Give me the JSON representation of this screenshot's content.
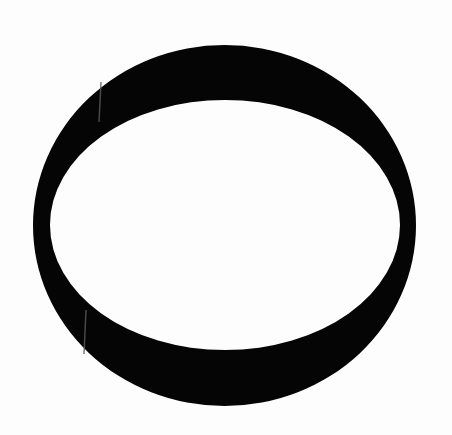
{
  "image": {
    "width": 452,
    "height": 435,
    "background_color": "#fdfdfd",
    "subject": "black elliptical ring on white paper (scanned)"
  },
  "ring": {
    "color": "#050505",
    "outer": {
      "cx": 224.5,
      "cy": 225.5,
      "rx": 191.5,
      "ry": 180.5
    },
    "inner": {
      "cx": 225,
      "cy": 225,
      "rx": 175,
      "ry": 125
    },
    "inner_fill": "#ffffff"
  },
  "artifacts": [
    {
      "type": "scan-streak",
      "x1": 101,
      "y1": 82,
      "x2": 99,
      "y2": 122,
      "color": "#5a5a5a"
    },
    {
      "type": "scan-streak",
      "x1": 86,
      "y1": 310,
      "x2": 84,
      "y2": 354,
      "color": "#5a5a5a"
    }
  ]
}
